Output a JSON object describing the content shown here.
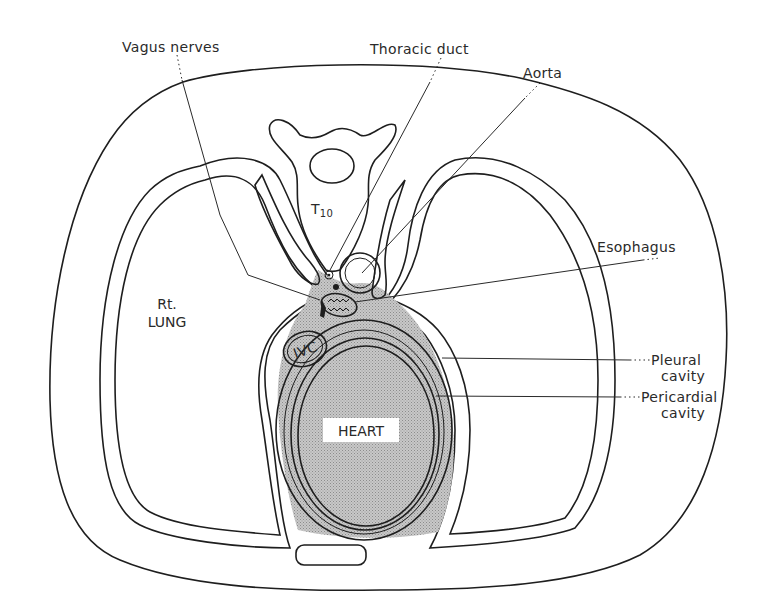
{
  "figure": {
    "colors": {
      "background": "#ffffff",
      "line": "#1e1e1e",
      "lung_stipple": "#d2d2d2",
      "heart_hatch": "#c9c9c9",
      "pericardium_stipple": "#bdbdbd"
    }
  },
  "labels": {
    "vagus_nerves": "Vagus nerves",
    "thoracic_duct": "Thoracic duct",
    "aorta": "Aorta",
    "esophagus": "Esophagus",
    "pleural_cavity_line1": "Pleural",
    "pleural_cavity_line2": "cavity",
    "pericardial_cavity_line1": "Pericardial",
    "pericardial_cavity_line2": "cavity",
    "rt_lung_line1": "Rt.",
    "rt_lung_line2": "LUNG",
    "heart": "HEART",
    "ivc": "IVC",
    "vertebra_letter": "T",
    "vertebra_number": "10"
  }
}
